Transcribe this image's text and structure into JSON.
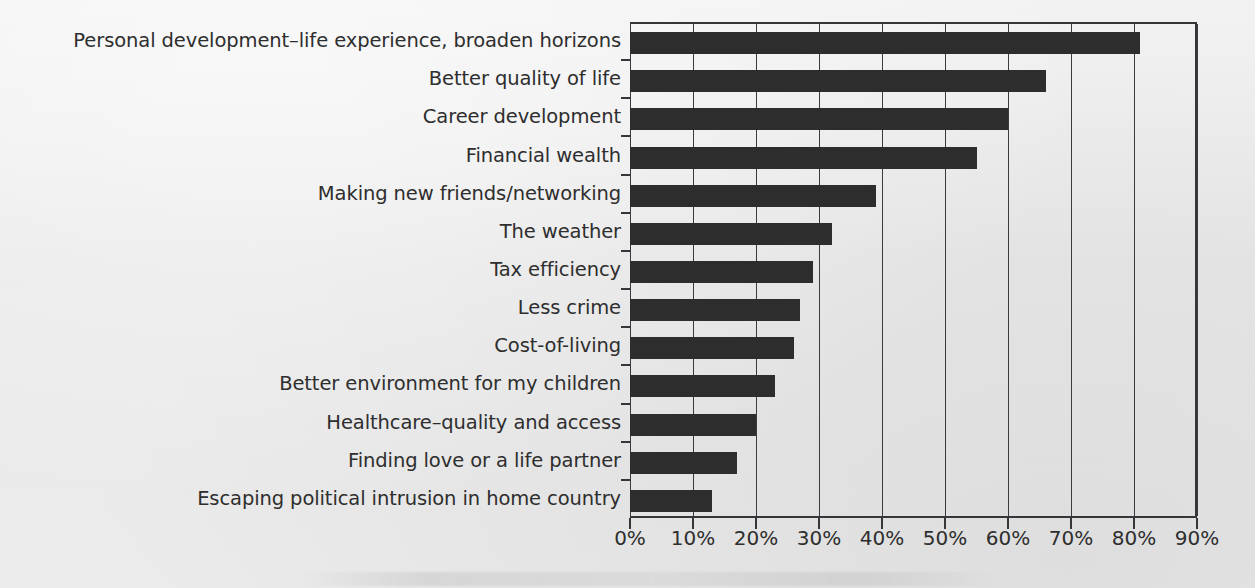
{
  "chart_data": {
    "type": "bar",
    "orientation": "horizontal",
    "title": "",
    "subtitle": "",
    "xlabel": "",
    "ylabel": "",
    "xlim": [
      0,
      90
    ],
    "grid": true,
    "legend": false,
    "legend_position": "none",
    "tick_labels": [
      "0%",
      "10%",
      "20%",
      "30%",
      "40%",
      "50%",
      "60%",
      "70%",
      "80%",
      "90%"
    ],
    "tick_values": [
      0,
      10,
      20,
      30,
      40,
      50,
      60,
      70,
      80,
      90
    ],
    "categories": [
      "Personal development–life experience, broaden horizons",
      "Better quality of life",
      "Career development",
      "Financial wealth",
      "Making new friends/networking",
      "The weather",
      "Tax efficiency",
      "Less crime",
      "Cost-of-living",
      "Better environment for my children",
      "Healthcare–quality and access",
      "Finding love or a life partner",
      "Escaping political intrusion in home country"
    ],
    "values": [
      81,
      66,
      60,
      55,
      39,
      32,
      29,
      27,
      26,
      23,
      20,
      17,
      13
    ],
    "value_unit": "%",
    "colors": {
      "bar": "#2d2d2d",
      "axis": "#35353a",
      "grid": "#3a3a40",
      "text": "#2e2e2e",
      "background": "#eaeaea"
    }
  }
}
